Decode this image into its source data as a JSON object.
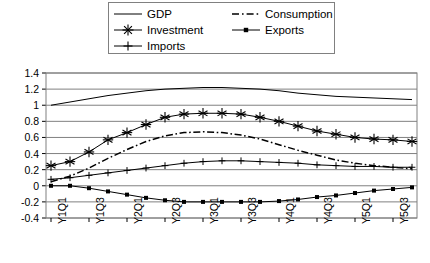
{
  "chart_data": {
    "type": "line",
    "title": "",
    "xlabel": "",
    "ylabel": "",
    "ylim": [
      -0.4,
      1.4
    ],
    "yticks": [
      -0.4,
      -0.2,
      0,
      0.2,
      0.4,
      0.6,
      0.8,
      1,
      1.2,
      1.4
    ],
    "ytick_labels": [
      "-0.4",
      "-0.2",
      "0",
      "0.2",
      "0.4",
      "0.6",
      "0.8",
      "1",
      "1.2",
      "1.4"
    ],
    "grid": true,
    "legend_position": "top-center",
    "x": [
      "Y1Q1",
      "Y1Q2",
      "Y1Q3",
      "Y1Q4",
      "Y2Q1",
      "Y2Q2",
      "Y2Q3",
      "Y2Q4",
      "Y3Q1",
      "Y3Q2",
      "Y3Q3",
      "Y3Q4",
      "Y4Q1",
      "Y4Q2",
      "Y4Q3",
      "Y4Q4",
      "Y5Q1",
      "Y5Q2",
      "Y5Q3",
      "Y5Q4"
    ],
    "xtick_labels": [
      "Y1Q1",
      "Y1Q3",
      "Y2Q1",
      "Y2Q3",
      "Y3Q1",
      "Y3Q3",
      "Y4Q1",
      "Y4Q3",
      "Y5Q1",
      "Y5Q3"
    ],
    "xtick_indices": [
      0,
      2,
      4,
      6,
      8,
      10,
      12,
      14,
      16,
      18
    ],
    "series": [
      {
        "name": "GDP",
        "style": "solid-line",
        "marker": "none",
        "color": "#000000",
        "values": [
          1.0,
          1.04,
          1.08,
          1.12,
          1.15,
          1.18,
          1.2,
          1.21,
          1.22,
          1.22,
          1.21,
          1.2,
          1.18,
          1.15,
          1.13,
          1.11,
          1.1,
          1.09,
          1.08,
          1.07
        ]
      },
      {
        "name": "Investment",
        "style": "solid-line",
        "marker": "asterisk",
        "color": "#000000",
        "values": [
          0.25,
          0.3,
          0.42,
          0.57,
          0.66,
          0.76,
          0.85,
          0.89,
          0.9,
          0.9,
          0.89,
          0.85,
          0.8,
          0.74,
          0.68,
          0.64,
          0.6,
          0.58,
          0.57,
          0.55
        ]
      },
      {
        "name": "Imports",
        "style": "solid-line",
        "marker": "plus",
        "color": "#000000",
        "values": [
          0.08,
          0.1,
          0.13,
          0.16,
          0.19,
          0.22,
          0.25,
          0.28,
          0.3,
          0.31,
          0.31,
          0.3,
          0.29,
          0.28,
          0.26,
          0.25,
          0.24,
          0.24,
          0.23,
          0.23
        ]
      },
      {
        "name": "Consumption",
        "style": "dash-dot-line",
        "marker": "none",
        "color": "#000000",
        "values": [
          0.05,
          0.12,
          0.22,
          0.34,
          0.45,
          0.55,
          0.62,
          0.66,
          0.67,
          0.66,
          0.63,
          0.58,
          0.51,
          0.44,
          0.38,
          0.32,
          0.28,
          0.25,
          0.23,
          0.21
        ]
      },
      {
        "name": "Exports",
        "style": "solid-line",
        "marker": "square-dot",
        "color": "#000000",
        "values": [
          0.0,
          0.0,
          -0.03,
          -0.07,
          -0.11,
          -0.15,
          -0.18,
          -0.2,
          -0.2,
          -0.2,
          -0.2,
          -0.2,
          -0.19,
          -0.17,
          -0.14,
          -0.12,
          -0.09,
          -0.06,
          -0.04,
          -0.02
        ]
      }
    ]
  },
  "legend": {
    "items": [
      {
        "label": "GDP"
      },
      {
        "label": "Investment"
      },
      {
        "label": "Imports"
      },
      {
        "label": "Consumption"
      },
      {
        "label": "Exports"
      }
    ]
  },
  "colors": {
    "plot_line": "#000000",
    "grid": "#808080",
    "frame": "#808080",
    "background": "#ffffff"
  }
}
